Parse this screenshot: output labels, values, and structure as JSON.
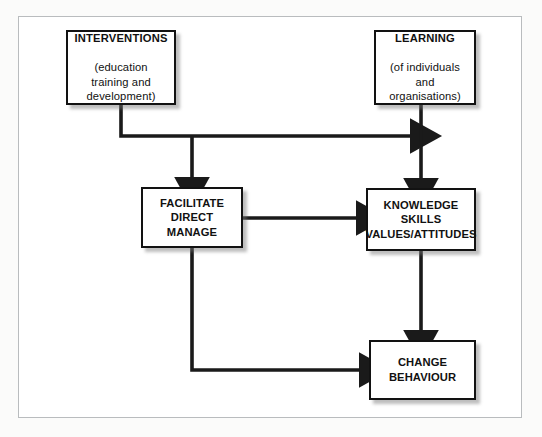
{
  "diagram": {
    "background_color": "#ffffff",
    "page_background_color": "#fbfbfa",
    "frame_border_color": "#b9bcbe",
    "box_border_color": "#121212",
    "shadow_color": "#787878",
    "line_color": "#1a1a1a",
    "nodes": [
      {
        "id": "interventions",
        "heading": "INTERVENTIONS",
        "subtext": "(education\ntraining and\ndevelopment)"
      },
      {
        "id": "learning",
        "heading": "LEARNING",
        "subtext": "(of individuals\nand\norganisations)"
      },
      {
        "id": "facilitate",
        "text": "FACILITATE\nDIRECT\nMANAGE"
      },
      {
        "id": "knowledge",
        "text": "KNOWLEDGE\nSKILLS\nVALUES/ATTITUDES"
      },
      {
        "id": "change",
        "text": "CHANGE\nBEHAVIOUR"
      }
    ],
    "connectors": [
      {
        "id": "interventions-to-learning-line",
        "from": "interventions",
        "to": "learning-descender",
        "style": "elbow-right-arrow"
      },
      {
        "id": "interventions-to-facilitate",
        "from": "interventions",
        "to": "facilitate",
        "style": "branch-down-arrow"
      },
      {
        "id": "learning-to-knowledge",
        "from": "learning",
        "to": "knowledge",
        "style": "straight-down-arrow"
      },
      {
        "id": "facilitate-to-knowledge",
        "from": "facilitate",
        "to": "knowledge",
        "style": "straight-right-arrow"
      },
      {
        "id": "facilitate-to-change",
        "from": "facilitate",
        "to": "change",
        "style": "elbow-down-right-arrow"
      },
      {
        "id": "knowledge-to-change",
        "from": "knowledge",
        "to": "change",
        "style": "straight-down-arrow"
      }
    ]
  }
}
